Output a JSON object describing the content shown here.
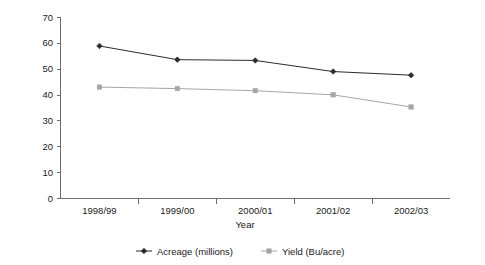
{
  "chart_data": {
    "type": "line",
    "title": "",
    "xlabel": "Year",
    "ylabel": "",
    "categories": [
      "1998/99",
      "1999/00",
      "2000/01",
      "2001/02",
      "2002/03"
    ],
    "series": [
      {
        "name": "Acreage (millions)",
        "values": [
          58.8,
          53.5,
          53.2,
          48.9,
          47.5
        ],
        "color": "#2b2b2b",
        "marker": "diamond"
      },
      {
        "name": "Yield (Bu/acre)",
        "values": [
          42.9,
          42.3,
          41.5,
          39.9,
          35.2
        ],
        "color": "#a6a6a6",
        "marker": "square"
      }
    ],
    "ylim": [
      0,
      70
    ],
    "ytick_step": 10,
    "yticks": [
      "0",
      "10",
      "20",
      "30",
      "40",
      "50",
      "60",
      "70"
    ],
    "grid": false,
    "legend_position": "bottom",
    "axis_color": "#6e6e6e",
    "background": "#ffffff"
  },
  "legend": {
    "entries": [
      {
        "label": "Acreage (millions)"
      },
      {
        "label": "Yield (Bu/acre)"
      }
    ]
  }
}
